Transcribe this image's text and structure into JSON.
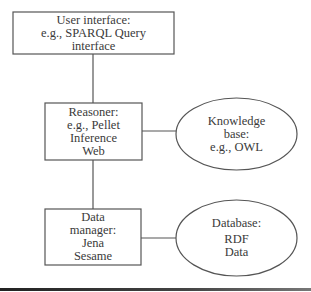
{
  "diagram": {
    "nodes": [
      {
        "id": "user-interface",
        "shape": "rectangle",
        "lines": [
          "User interface:",
          "e.g., SPARQL Query",
          "interface"
        ]
      },
      {
        "id": "reasoner",
        "shape": "rectangle",
        "lines": [
          "Reasoner:",
          "e.g., Pellet",
          "Inference",
          "Web"
        ]
      },
      {
        "id": "knowledge-base",
        "shape": "ellipse",
        "lines": [
          "Knowledge",
          "base:",
          "e.g., OWL"
        ]
      },
      {
        "id": "data-manager",
        "shape": "rectangle",
        "lines": [
          "Data",
          "manager:",
          "Jena",
          "Sesame"
        ]
      },
      {
        "id": "database",
        "shape": "ellipse",
        "lines": [
          "Database:",
          "RDF",
          "Data"
        ]
      }
    ],
    "edges": [
      {
        "from": "user-interface",
        "to": "reasoner"
      },
      {
        "from": "reasoner",
        "to": "knowledge-base"
      },
      {
        "from": "reasoner",
        "to": "data-manager"
      },
      {
        "from": "data-manager",
        "to": "database"
      }
    ],
    "colors": {
      "stroke": "#555555",
      "text": "#3a3a3a",
      "rule": "#222222"
    }
  }
}
